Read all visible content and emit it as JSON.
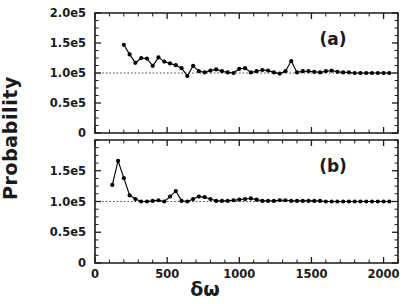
{
  "figure": {
    "ylabel": "Probability",
    "xlabel": "δω",
    "background_color": "#ffffff",
    "foreground_color": "#1a1a1a"
  },
  "chart_data": [
    {
      "type": "line",
      "panel": "a",
      "panel_label": "(a)",
      "title": "",
      "xlabel": "δω",
      "ylabel": "Probability",
      "xlim": [
        0,
        2100
      ],
      "ylim": [
        0,
        200000
      ],
      "xticks": [
        0,
        500,
        1000,
        1500,
        2000
      ],
      "xticklabels": [
        "0",
        "500",
        "1000",
        "1500",
        "2000"
      ],
      "yticks": [
        0,
        50000,
        100000,
        150000,
        200000
      ],
      "yticklabels": [
        "0",
        "0.5e5",
        "1.0e5",
        "1.5e5",
        "2.0e5"
      ],
      "grid": false,
      "legend": "none",
      "reference_line": {
        "orientation": "horizontal",
        "value": 100000,
        "style": "dotted"
      },
      "marker": "filled-circle",
      "x": [
        200,
        240,
        280,
        320,
        360,
        400,
        440,
        480,
        520,
        560,
        600,
        640,
        680,
        720,
        760,
        800,
        840,
        880,
        920,
        960,
        1000,
        1040,
        1080,
        1120,
        1160,
        1200,
        1240,
        1280,
        1320,
        1360,
        1400,
        1440,
        1480,
        1520,
        1560,
        1600,
        1640,
        1680,
        1720,
        1760,
        1800,
        1840,
        1880,
        1920,
        1960,
        2000,
        2040
      ],
      "y": [
        147000,
        131000,
        117000,
        125000,
        124000,
        112000,
        126000,
        119000,
        116000,
        113000,
        108000,
        95000,
        112000,
        103000,
        101000,
        104000,
        106000,
        103000,
        101000,
        100000,
        107000,
        108000,
        101000,
        103000,
        105000,
        104000,
        101000,
        99000,
        103000,
        120000,
        101000,
        103000,
        103000,
        102000,
        101000,
        103000,
        104000,
        102000,
        101000,
        101000,
        100000,
        100000,
        100000,
        100000,
        100000,
        100000,
        100000
      ]
    },
    {
      "type": "line",
      "panel": "b",
      "panel_label": "(b)",
      "title": "",
      "xlabel": "δω",
      "ylabel": "Probability",
      "xlim": [
        0,
        2100
      ],
      "ylim": [
        0,
        200000
      ],
      "xticks": [
        0,
        500,
        1000,
        1500,
        2000
      ],
      "xticklabels": [
        "0",
        "500",
        "1000",
        "1500",
        "2000"
      ],
      "yticks": [
        0,
        50000,
        100000,
        150000
      ],
      "yticklabels": [
        "0",
        "0.5e5",
        "1.0e5",
        "1.5e5"
      ],
      "grid": false,
      "legend": "none",
      "reference_line": {
        "orientation": "horizontal",
        "value": 100000,
        "style": "dotted"
      },
      "marker": "filled-circle",
      "x": [
        120,
        160,
        200,
        240,
        280,
        320,
        360,
        400,
        440,
        480,
        520,
        560,
        600,
        640,
        680,
        720,
        760,
        800,
        840,
        880,
        920,
        960,
        1000,
        1040,
        1080,
        1120,
        1160,
        1200,
        1240,
        1280,
        1320,
        1360,
        1400,
        1440,
        1480,
        1520,
        1560,
        1600,
        1640,
        1680,
        1720,
        1760,
        1800,
        1840,
        1880,
        1920,
        1960,
        2000,
        2040
      ],
      "y": [
        127000,
        166000,
        138000,
        110000,
        104000,
        100000,
        100000,
        101000,
        102000,
        100000,
        108000,
        117000,
        101000,
        100000,
        104000,
        108000,
        107000,
        104000,
        101000,
        101000,
        101000,
        102000,
        103000,
        104000,
        105000,
        103000,
        101000,
        101000,
        101000,
        102000,
        102000,
        101000,
        101000,
        101000,
        101000,
        101000,
        101000,
        100000,
        100000,
        100000,
        100000,
        100000,
        100000,
        100000,
        100000,
        100000,
        100000,
        100000,
        100000
      ]
    }
  ]
}
